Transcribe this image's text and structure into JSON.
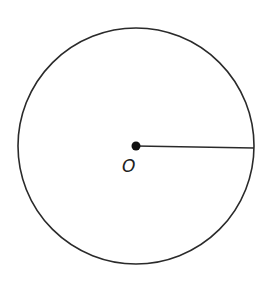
{
  "diagram": {
    "circle": {
      "cx": 136,
      "cy": 146,
      "r": 118,
      "stroke": "#2a2a2a"
    },
    "center_point": {
      "label": "O",
      "cx": 136,
      "cy": 146
    },
    "radius_segment": {
      "x1": 136,
      "y1": 146,
      "x2": 254,
      "y2": 148
    }
  }
}
